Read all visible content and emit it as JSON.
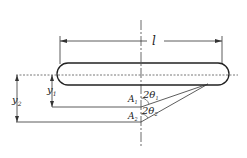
{
  "diagram": {
    "labels": {
      "length": "l",
      "y1": "y",
      "y1_sub": "1",
      "y2": "y",
      "y2_sub": "2",
      "A1": "A",
      "A1_sub": "1",
      "A2": "A",
      "A2_sub": "2",
      "theta1": "2θ",
      "theta1_sub": "1",
      "theta2": "2θ",
      "theta2_sub": "2"
    },
    "colors": {
      "stroke": "#222222",
      "background": "#ffffff"
    }
  }
}
